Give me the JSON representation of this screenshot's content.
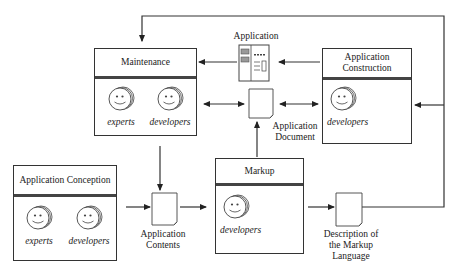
{
  "diagram": {
    "type": "process-flow",
    "boxes": {
      "maintenance": {
        "title": "Maintenance",
        "actors": [
          "experts",
          "developers"
        ]
      },
      "construction": {
        "title_line1": "Application",
        "title_line2": "Construction",
        "actors": [
          "developers"
        ]
      },
      "conception": {
        "title": "Application Conception",
        "actors": [
          "experts",
          "developers"
        ]
      },
      "markup": {
        "title": "Markup",
        "actors": [
          "developers"
        ]
      }
    },
    "artifacts": {
      "application": {
        "label": "Application"
      },
      "app_document": {
        "label_line1": "Application",
        "label_line2": "Document"
      },
      "app_contents": {
        "label_line1": "Application",
        "label_line2": "Contents"
      },
      "markup_description": {
        "label_line1": "Description of",
        "label_line2": "the Markup",
        "label_line3": "Language"
      }
    },
    "colors": {
      "line": "#333333",
      "background": "#ffffff"
    }
  }
}
